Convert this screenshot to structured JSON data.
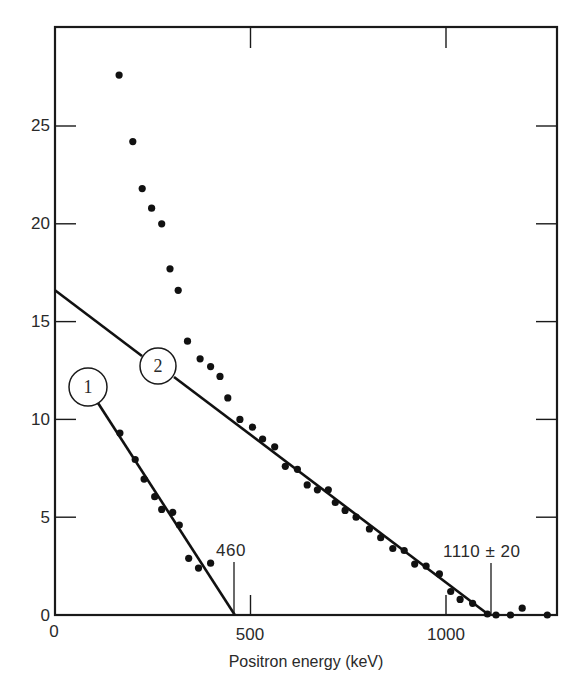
{
  "chart_data": {
    "type": "scatter",
    "title": "",
    "xlabel": "Positron energy (keV)",
    "ylabel": "",
    "xlim": [
      0,
      1284
    ],
    "ylim": [
      0,
      30
    ],
    "x_ticks": [
      0,
      500,
      1000
    ],
    "x_tick_labels": [
      "0",
      "500",
      "1000"
    ],
    "y_ticks": [
      0,
      5,
      10,
      15,
      20,
      25
    ],
    "y_tick_labels": [
      "0",
      "5",
      "10",
      "15",
      "20",
      "25"
    ],
    "grid": false,
    "legend": null,
    "series": [
      {
        "name": "measured points (upper spectrum)",
        "marker": "filled-circle",
        "points": [
          [
            164,
            27.6
          ],
          [
            199,
            24.2
          ],
          [
            223,
            21.8
          ],
          [
            247,
            20.8
          ],
          [
            273,
            20.0
          ],
          [
            294,
            17.7
          ],
          [
            315,
            16.6
          ],
          [
            339,
            14.0
          ],
          [
            371,
            13.1
          ],
          [
            398,
            12.7
          ],
          [
            422,
            12.2
          ],
          [
            442,
            11.1
          ],
          [
            473,
            10.0
          ],
          [
            505,
            9.6
          ],
          [
            531,
            9.0
          ],
          [
            562,
            8.6
          ],
          [
            589,
            7.6
          ],
          [
            620,
            7.45
          ],
          [
            645,
            6.65
          ],
          [
            671,
            6.4
          ],
          [
            699,
            6.4
          ],
          [
            717,
            5.75
          ],
          [
            742,
            5.35
          ],
          [
            770,
            5.0
          ],
          [
            804,
            4.4
          ],
          [
            833,
            3.95
          ],
          [
            864,
            3.4
          ],
          [
            893,
            3.3
          ],
          [
            920,
            2.6
          ],
          [
            949,
            2.5
          ],
          [
            983,
            2.1
          ],
          [
            1012,
            1.2
          ],
          [
            1036,
            0.8
          ],
          [
            1068,
            0.6
          ],
          [
            1106,
            0.05
          ],
          [
            1128,
            0.0
          ],
          [
            1165,
            0.0
          ],
          [
            1195,
            0.35
          ],
          [
            1259,
            0.0
          ]
        ]
      },
      {
        "name": "subtracted points (component 1)",
        "marker": "filled-circle",
        "points": [
          [
            166,
            9.3
          ],
          [
            205,
            7.95
          ],
          [
            228,
            6.95
          ],
          [
            255,
            6.05
          ],
          [
            273,
            5.4
          ],
          [
            301,
            5.25
          ],
          [
            318,
            4.6
          ],
          [
            342,
            2.9
          ],
          [
            367,
            2.4
          ],
          [
            398,
            2.65
          ]
        ]
      }
    ],
    "fit_lines": [
      {
        "id": "1",
        "label": "1",
        "x": [
          110,
          460
        ],
        "y": [
          11.0,
          0
        ],
        "endpoint_keV": 460,
        "endpoint_label": "460"
      },
      {
        "id": "2",
        "label": "2",
        "x": [
          0,
          1110
        ],
        "y": [
          16.6,
          0
        ],
        "endpoint_keV": 1110,
        "endpoint_label": "1110 ± 20"
      }
    ],
    "annotations": [
      {
        "text": "460",
        "x": 460,
        "y": 3.3,
        "type": "endpoint-marker"
      },
      {
        "text": "1110 ± 20",
        "x": 1110,
        "y": 3.3,
        "type": "endpoint-marker"
      },
      {
        "text": "1",
        "x": 83,
        "y": 11.7,
        "type": "circled-series-label"
      },
      {
        "text": "2",
        "x": 263,
        "y": 12.6,
        "type": "circled-series-label"
      }
    ]
  },
  "labels": {
    "xlabel": "Positron energy (keV)",
    "x_ticks": [
      "0",
      "500",
      "1000"
    ],
    "y_ticks": [
      "0",
      "5",
      "10",
      "15",
      "20",
      "25"
    ],
    "endpoint_1": "460",
    "endpoint_2": "1110 ± 20",
    "series_1": "1",
    "series_2": "2"
  }
}
